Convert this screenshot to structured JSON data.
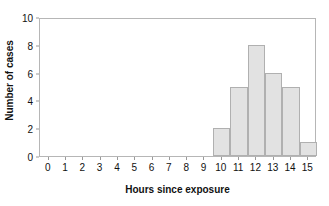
{
  "chart_data": {
    "type": "bar",
    "title": "",
    "subtitle": "",
    "xlabel": "Hours since exposure",
    "ylabel": "Number of cases",
    "categories": [
      0,
      1,
      2,
      3,
      4,
      5,
      6,
      7,
      8,
      9,
      10,
      11,
      12,
      13,
      14,
      15
    ],
    "values": [
      0,
      0,
      0,
      0,
      0,
      0,
      0,
      0,
      0,
      0,
      2,
      5,
      8,
      6,
      5,
      1
    ],
    "series": [
      {
        "name": "Number of cases",
        "values": [
          0,
          0,
          0,
          0,
          0,
          0,
          0,
          0,
          0,
          0,
          2,
          5,
          8,
          6,
          5,
          1
        ]
      }
    ],
    "xlim": [
      -0.5,
      15.5
    ],
    "ylim": [
      0,
      10
    ],
    "x_tick_labels": [
      "0",
      "1",
      "2",
      "3",
      "4",
      "5",
      "6",
      "7",
      "8",
      "9",
      "10",
      "11",
      "12",
      "13",
      "14",
      "15"
    ],
    "y_tick_labels": [
      "0",
      "2",
      "4",
      "6",
      "8",
      "10"
    ],
    "y_tick_values": [
      0,
      2,
      4,
      6,
      8,
      10
    ],
    "grid": false,
    "legend": false,
    "legend_position": "none",
    "bar_fill_color": "#e2e2e2",
    "bar_border_color": "#b0b0b0",
    "axis_color": "#b6b6b6",
    "text_color": "#111111",
    "annotations": []
  }
}
